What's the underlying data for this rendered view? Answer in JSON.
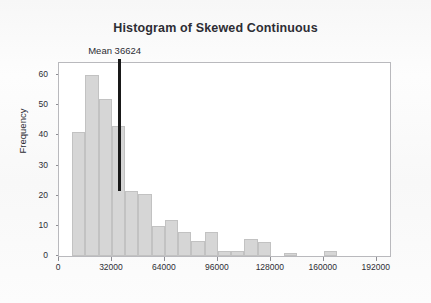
{
  "chart_data": {
    "type": "bar",
    "title": "Histogram of Skewed Continuous",
    "xlabel": "",
    "ylabel": "Frequency",
    "xlim": [
      0,
      200000
    ],
    "ylim": [
      0,
      64
    ],
    "grid": false,
    "legend": null,
    "bin_width": 8000,
    "x_ticks": [
      0,
      32000,
      64000,
      96000,
      128000,
      160000,
      192000
    ],
    "x_tick_labels": [
      "0",
      "32000",
      "64000",
      "96000",
      "128000",
      "160000",
      "192000"
    ],
    "y_ticks": [
      0,
      10,
      20,
      30,
      40,
      50,
      60
    ],
    "y_tick_labels": [
      "0",
      "10",
      "20",
      "30",
      "40",
      "50",
      "60"
    ],
    "bins": [
      {
        "start": 8000,
        "end": 16000,
        "value": 41
      },
      {
        "start": 16000,
        "end": 24000,
        "value": 60
      },
      {
        "start": 24000,
        "end": 32000,
        "value": 52
      },
      {
        "start": 32000,
        "end": 40000,
        "value": 43
      },
      {
        "start": 40000,
        "end": 48000,
        "value": 21.5
      },
      {
        "start": 48000,
        "end": 56000,
        "value": 20.5
      },
      {
        "start": 56000,
        "end": 64000,
        "value": 10
      },
      {
        "start": 64000,
        "end": 72000,
        "value": 12
      },
      {
        "start": 72000,
        "end": 80000,
        "value": 8
      },
      {
        "start": 80000,
        "end": 88000,
        "value": 5
      },
      {
        "start": 88000,
        "end": 96000,
        "value": 8
      },
      {
        "start": 96000,
        "end": 104000,
        "value": 1.5
      },
      {
        "start": 104000,
        "end": 112000,
        "value": 1.5
      },
      {
        "start": 112000,
        "end": 120000,
        "value": 5.5
      },
      {
        "start": 120000,
        "end": 128000,
        "value": 4.5
      },
      {
        "start": 136000,
        "end": 144000,
        "value": 1
      },
      {
        "start": 160000,
        "end": 168000,
        "value": 1.5
      }
    ],
    "annotations": [
      {
        "name": "mean-line",
        "label": "Mean 36624",
        "x_value": 36624,
        "color": "#191919"
      }
    ],
    "colors": {
      "bar_fill": "#d6d6d6",
      "bar_border": "#c2c2c2",
      "frame": "#b9b9bd",
      "text": "#2d2d34",
      "plot_background": "#ffffff",
      "figure_background": "#fbfbfb",
      "mean_line": "#191919"
    }
  }
}
